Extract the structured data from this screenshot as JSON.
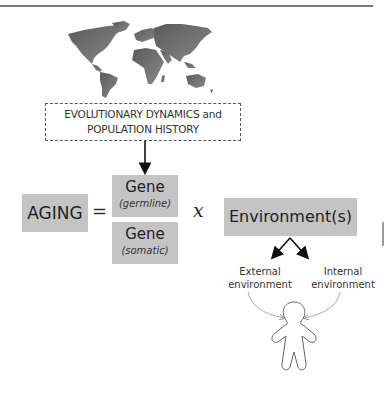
{
  "diagram": {
    "world_map_icon": "world-map",
    "header_box": {
      "line1": "EVOLUTIONARY DYNAMICS and",
      "line2": "POPULATION HISTORY"
    },
    "equation": {
      "lhs": "AGING",
      "equals": "=",
      "gene_germline": {
        "label": "Gene",
        "sublabel": "(germline)"
      },
      "gene_somatic": {
        "label": "Gene",
        "sublabel": "(somatic)"
      },
      "times": "x",
      "environment": "Environment(s)"
    },
    "environment_branches": {
      "external": {
        "line1": "External",
        "line2": "environment"
      },
      "internal": {
        "line1": "Internal",
        "line2": "environment"
      }
    },
    "person_icon": "human-figure",
    "colors": {
      "box_fill": "#c4c4c4",
      "map_fill": "#6b6b6b",
      "text": "#222222",
      "arrow": "#111111",
      "thin_arrow": "#aaaaaa"
    }
  }
}
